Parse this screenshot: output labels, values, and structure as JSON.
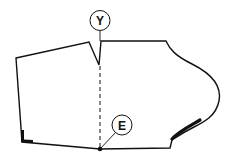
{
  "diagram": {
    "type": "sewing-pattern",
    "labels": {
      "top_marker": "Y",
      "bottom_marker": "E"
    },
    "colors": {
      "line": "#111111",
      "background": "#ffffff"
    }
  }
}
